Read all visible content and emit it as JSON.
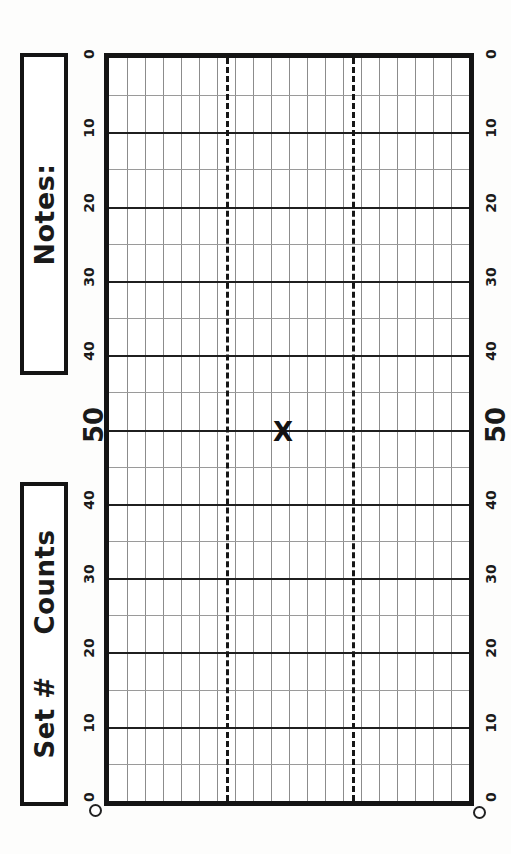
{
  "sheet": {
    "title": "Counts tally grid sheet",
    "background_color": "#fdfdfc",
    "ink_color": "#141414"
  },
  "labels": {
    "notes": "Notes:",
    "set_number": "Set #",
    "counts": "Counts"
  },
  "mark": {
    "glyph": "X",
    "value_label": "50",
    "column_index": 10,
    "x_px": 283,
    "y_px": 432
  },
  "chart_data": {
    "type": "table",
    "title": "Counts",
    "xlabel": "Set #",
    "ylabel": "Counts",
    "grid": true,
    "legend": "none",
    "axis_left_ticks": [
      0,
      10,
      20,
      30,
      40,
      50,
      40,
      30,
      20,
      10,
      0
    ],
    "axis_right_ticks": [
      0,
      10,
      20,
      30,
      40,
      50,
      40,
      30,
      20,
      10,
      0
    ],
    "major_tick_label": "50",
    "minor_tick_labels": [
      "0",
      "10",
      "20",
      "30",
      "40",
      "40",
      "30",
      "20",
      "10",
      "0"
    ],
    "ylim": [
      0,
      100
    ],
    "y_tick_interval": 5,
    "columns": 20,
    "rows": 20,
    "dashed_reference_columns": [
      6.5,
      13.5
    ],
    "series": [
      {
        "name": "marks",
        "points": [
          {
            "x": 10,
            "y": 50,
            "label": "X"
          }
        ]
      }
    ],
    "annotations": [
      "X"
    ]
  }
}
